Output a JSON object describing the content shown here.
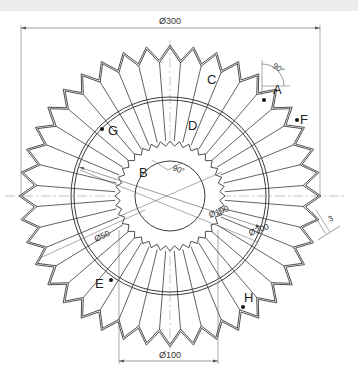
{
  "drawing": {
    "center": {
      "x": 170,
      "y": 196
    },
    "outer_radius": 151,
    "valley_radius": 136,
    "outer_teeth": 40,
    "outline_offset": 2.5,
    "ring_outer_radius": 99,
    "ring_inner_radius": 96,
    "gear_tip_radius": 55,
    "gear_root_radius": 50,
    "gear_teeth": 36,
    "hub_radius": 35,
    "line_color": "#3a3a3a",
    "centerline_color": "#b0b0b0",
    "dim_color": "#555555"
  },
  "dimensions": {
    "d300": {
      "label": "Ø300",
      "x1": 21,
      "x2": 320,
      "y": 28
    },
    "d100": {
      "label": "Ø100",
      "x1": 119,
      "x2": 218,
      "y": 361
    },
    "d190": {
      "label": "Ø190"
    },
    "d200": {
      "label": "Ø200"
    },
    "d50": {
      "label": "Ø50"
    },
    "angle_outer": {
      "label": "90°"
    },
    "angle_inner": {
      "label": "90°"
    },
    "thickness": {
      "label": "3"
    }
  },
  "points": [
    {
      "label": "A",
      "x": 264,
      "y": 100,
      "lx": 273,
      "ly": 94,
      "dot": true
    },
    {
      "label": "B",
      "lx": 139,
      "ly": 177,
      "dot": false
    },
    {
      "label": "C",
      "lx": 207,
      "ly": 84,
      "dot": false
    },
    {
      "label": "D",
      "lx": 188,
      "ly": 130,
      "dot": false
    },
    {
      "label": "E",
      "x": 111,
      "y": 280,
      "lx": 95,
      "ly": 288,
      "dot": true
    },
    {
      "label": "F",
      "x": 297,
      "y": 120,
      "lx": 300,
      "ly": 124,
      "dot": true
    },
    {
      "label": "G",
      "x": 102,
      "y": 129,
      "lx": 108,
      "ly": 135,
      "dot": true
    },
    {
      "label": "H",
      "x": 243,
      "y": 307,
      "lx": 244,
      "ly": 302,
      "dot": true
    }
  ]
}
